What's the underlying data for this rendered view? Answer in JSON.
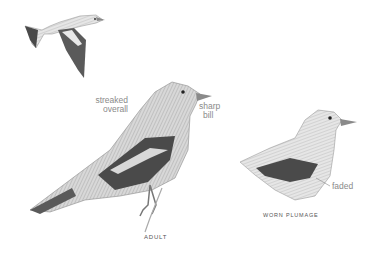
{
  "figures": {
    "flying": {
      "name": "flying bird"
    },
    "adult": {
      "caption": "ADULT"
    },
    "worn": {
      "caption": "WORN PLUMAGE"
    }
  },
  "annotations": {
    "streaked_line1": "streaked",
    "streaked_line2": "overall",
    "sharp_line1": "sharp",
    "sharp_line2": "bill",
    "faded": "faded"
  },
  "colors": {
    "background": "#ffffff",
    "label": "#8a8a8a",
    "caption": "#555555"
  }
}
